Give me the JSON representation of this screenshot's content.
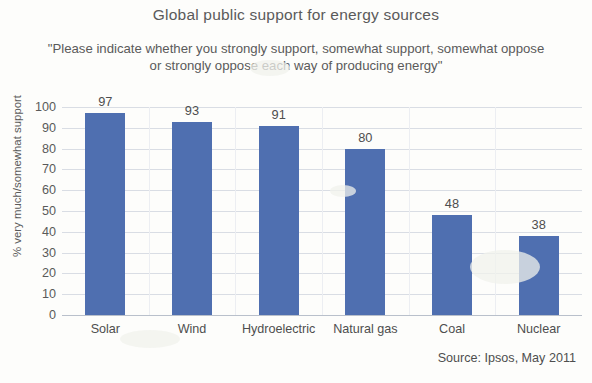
{
  "title": "Global public support for energy sources",
  "subtitle_lines": [
    "\"Please indicate whether you strongly support, somewhat support, somewhat oppose",
    "or strongly oppose each way of producing energy\""
  ],
  "source": "Source: Ipsos, May 2011",
  "colors": {
    "bar": "#4f6fb0",
    "gridline": "#d9dde4",
    "axis": "#b9c0cb",
    "text": "#4e4e4e",
    "background": "#fdfdfb"
  },
  "chart_data": {
    "type": "bar",
    "title": "Global public support for energy sources",
    "subtitle": "\"Please indicate whether you strongly support, somewhat support, somewhat oppose or strongly oppose each way of producing energy\"",
    "categories": [
      "Solar",
      "Wind",
      "Hydroelectric",
      "Natural gas",
      "Coal",
      "Nuclear"
    ],
    "values": [
      97,
      93,
      91,
      80,
      48,
      38
    ],
    "xlabel": "",
    "ylabel": "% very much/somewhat support",
    "ylim": [
      0,
      100
    ],
    "ytick_labels": [
      "100",
      "90",
      "80",
      "70",
      "60",
      "50",
      "40",
      "30",
      "20",
      "10",
      "0"
    ],
    "ytick_values": [
      100,
      90,
      80,
      70,
      60,
      50,
      40,
      30,
      20,
      10,
      0
    ],
    "grid": true,
    "legend": "none",
    "data_labels": true,
    "source": "Source: Ipsos, May 2011"
  }
}
